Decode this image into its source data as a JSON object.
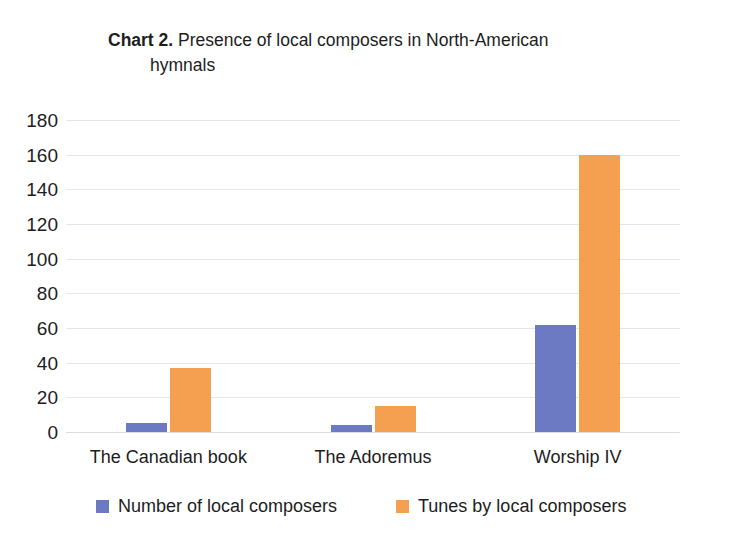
{
  "chart_data": {
    "type": "bar",
    "title": "Chart 2. Presence of local composers in North-American hymnals",
    "title_strong": "Chart 2.",
    "title_rest": " Presence of local composers in North-American",
    "title_line2": "hymnals",
    "xlabel": "",
    "ylabel": "",
    "ylim": [
      0,
      180
    ],
    "ytick_step": 20,
    "grid": true,
    "legend_position": "bottom",
    "categories": [
      "The Canadian book",
      "The Adoremus",
      "Worship IV"
    ],
    "ytick_labels": [
      "180",
      "160",
      "140",
      "120",
      "100",
      "80",
      "60",
      "40",
      "20",
      "0"
    ],
    "ytick_values": [
      180,
      160,
      140,
      120,
      100,
      80,
      60,
      40,
      20,
      0
    ],
    "series": [
      {
        "name": "Number of local composers",
        "color": "#6c7ac4",
        "values": [
          5,
          4,
          62
        ]
      },
      {
        "name": "Tunes by local composers",
        "color": "#f5a051",
        "values": [
          37,
          15,
          160
        ]
      }
    ]
  }
}
